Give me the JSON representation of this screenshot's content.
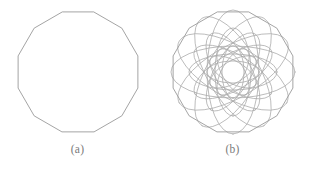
{
  "figure": {
    "background_color": "#ffffff",
    "stroke_color": "#9a9a9a",
    "curve_color": "#a6a6a6",
    "caption_color": "#7a7a7a",
    "panels": [
      {
        "id": "a",
        "caption": "(a)",
        "description": "regular twelve-sided polygon outline",
        "shape": "polygon",
        "sides": 12
      },
      {
        "id": "b",
        "caption": "(b)",
        "description": "twelve-sided polygon overlaid with rotated ellipse rosette forming a six-pointed star at centre",
        "shape": "polygon-with-ellipse-rosette",
        "sides": 12,
        "ellipse_rings": 3,
        "ellipses_per_ring": 6,
        "rose_symmetry": 6
      }
    ]
  },
  "chart_data": {
    "type": "diagram",
    "title": "",
    "panels": [
      {
        "label": "(a)",
        "geometry": "regular_polygon",
        "n_sides": 12,
        "center": [
          70,
          70
        ],
        "radius": 62,
        "rotation_deg": 15
      },
      {
        "label": "(b)",
        "geometry": "polygon_plus_ellipse_rosette",
        "n_sides": 12,
        "center": [
          70,
          70
        ],
        "radius": 62,
        "rotation_deg": 15,
        "ellipse_sets": [
          {
            "rx": 62,
            "ry": 26,
            "count": 6,
            "step_deg": 30
          },
          {
            "rx": 44,
            "ry": 18,
            "count": 6,
            "step_deg": 30
          },
          {
            "rx": 26,
            "ry": 11,
            "count": 6,
            "step_deg": 30
          }
        ]
      }
    ]
  }
}
